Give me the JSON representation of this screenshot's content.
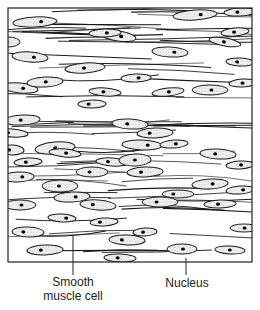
{
  "figure": {
    "colors": {
      "outline": "#1a1a1a",
      "stipple": "#777777",
      "background": "#ffffff",
      "nucleus": "#000000"
    },
    "labels": [
      {
        "id": "smooth",
        "text_line1": "Smooth",
        "text_line2": "muscle cell",
        "pointer_x": 73
      },
      {
        "id": "nucleus",
        "text": "Nucleus",
        "pointer_x": 186
      }
    ]
  }
}
